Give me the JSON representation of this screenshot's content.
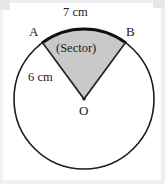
{
  "figure": {
    "background_color": "#ffffff",
    "stroke_color": "#1b1b1b",
    "sector_fill_color": "#c9c9c9",
    "labels": {
      "arc_length": "7 cm",
      "point_a": "A",
      "point_b": "B",
      "sector_caption": "(Sector)",
      "radius_length": "6 cm",
      "center_point": "O"
    },
    "geometry": {
      "circle_center_x": 84,
      "circle_center_y": 99,
      "circle_radius": 70,
      "point_a_x": 43,
      "point_a_y": 42,
      "point_b_x": 125,
      "point_b_y": 42,
      "arc_sweep_degrees": 114
    }
  }
}
